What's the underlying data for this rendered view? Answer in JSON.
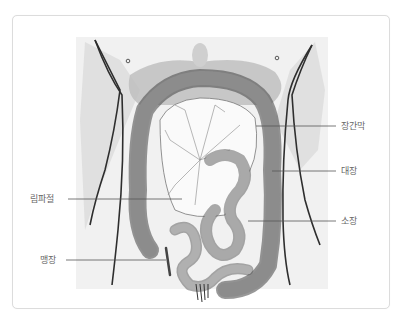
{
  "figure": {
    "labels": [
      {
        "id": "mesentery",
        "text": "장간막",
        "side": "right"
      },
      {
        "id": "large-intestine",
        "text": "대장",
        "side": "right"
      },
      {
        "id": "lymph-node",
        "text": "림파절",
        "side": "left"
      },
      {
        "id": "small-intestine",
        "text": "소장",
        "side": "right"
      },
      {
        "id": "appendix",
        "text": "맹장",
        "side": "left"
      }
    ]
  },
  "colors": {
    "frame_border": "#dcdcdc",
    "label_text": "#666666",
    "leader_line": "#555555",
    "background_shade": "#e6e6e6",
    "organ_fill": "#9a9a9a",
    "outline": "#333333"
  }
}
